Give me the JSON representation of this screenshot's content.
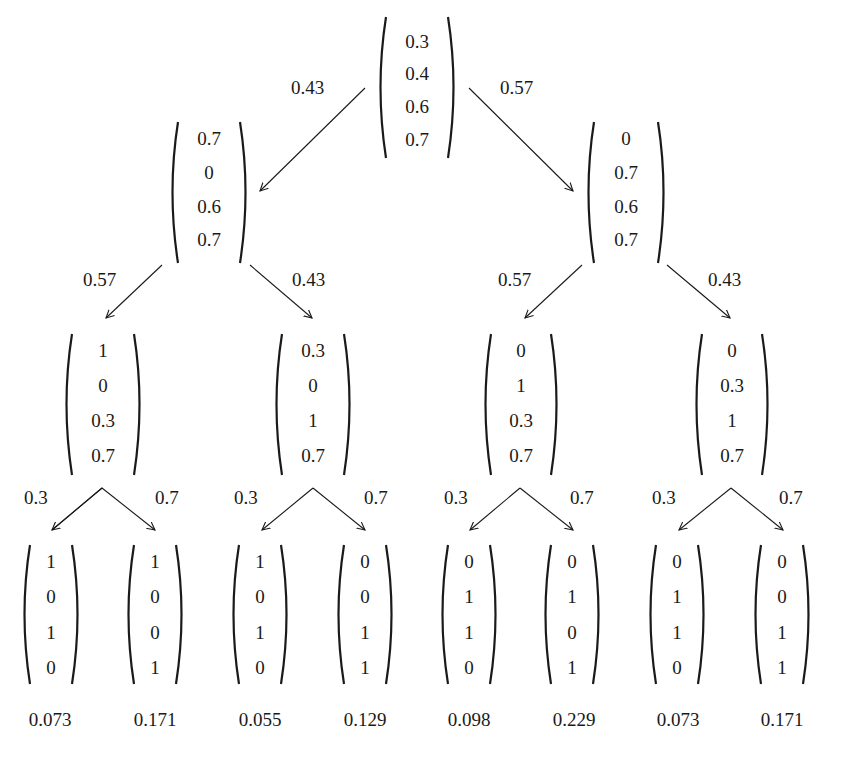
{
  "diagram": {
    "type": "probability-tree",
    "root": {
      "vector": [
        "0.3",
        "0.4",
        "0.6",
        "0.7"
      ]
    },
    "level1": [
      {
        "edge_label": "0.43",
        "vector": [
          "0.7",
          "0",
          "0.6",
          "0.7"
        ]
      },
      {
        "edge_label": "0.57",
        "vector": [
          "0",
          "0.7",
          "0.6",
          "0.7"
        ]
      }
    ],
    "level2": [
      {
        "edge_label": "0.57",
        "vector": [
          "1",
          "0",
          "0.3",
          "0.7"
        ]
      },
      {
        "edge_label": "0.43",
        "vector": [
          "0.3",
          "0",
          "1",
          "0.7"
        ]
      },
      {
        "edge_label": "0.57",
        "vector": [
          "0",
          "1",
          "0.3",
          "0.7"
        ]
      },
      {
        "edge_label": "0.43",
        "vector": [
          "0",
          "0.3",
          "1",
          "0.7"
        ]
      }
    ],
    "level3": [
      {
        "edge_label": "0.3",
        "vector": [
          "1",
          "0",
          "1",
          "0"
        ],
        "probability": "0.073"
      },
      {
        "edge_label": "0.7",
        "vector": [
          "1",
          "0",
          "0",
          "1"
        ],
        "probability": "0.171"
      },
      {
        "edge_label": "0.3",
        "vector": [
          "1",
          "0",
          "1",
          "0"
        ],
        "probability": "0.055"
      },
      {
        "edge_label": "0.7",
        "vector": [
          "0",
          "0",
          "1",
          "1"
        ],
        "probability": "0.129"
      },
      {
        "edge_label": "0.3",
        "vector": [
          "0",
          "1",
          "1",
          "0"
        ],
        "probability": "0.098"
      },
      {
        "edge_label": "0.7",
        "vector": [
          "0",
          "1",
          "0",
          "1"
        ],
        "probability": "0.229"
      },
      {
        "edge_label": "0.3",
        "vector": [
          "0",
          "1",
          "1",
          "0"
        ],
        "probability": "0.073"
      },
      {
        "edge_label": "0.7",
        "vector": [
          "0",
          "0",
          "1",
          "1"
        ],
        "probability": "0.171"
      }
    ]
  },
  "colors": {
    "ink": "#1a1a1a",
    "background": "#ffffff"
  }
}
